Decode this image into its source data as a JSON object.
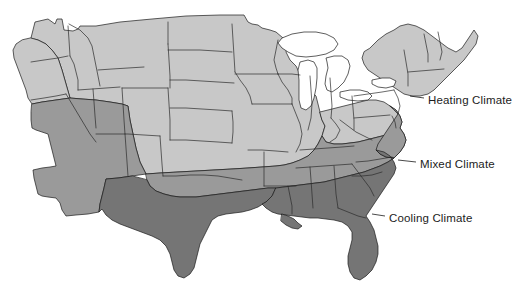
{
  "figure": {
    "width": 515,
    "height": 295,
    "background_color": "#ffffff"
  },
  "legend": {
    "items": [
      {
        "id": "heating",
        "label": "Heating Climate",
        "color": "#c8c8c8",
        "label_position": {
          "x": 428,
          "y": 94
        }
      },
      {
        "id": "mixed",
        "label": "Mixed Climate",
        "color": "#9a9a9a",
        "label_position": {
          "x": 420,
          "y": 158
        }
      },
      {
        "id": "cooling",
        "label": "Cooling Climate",
        "color": "#757575",
        "label_position": {
          "x": 389,
          "y": 212
        }
      }
    ]
  },
  "map": {
    "colors": {
      "heating": "#c8c8c8",
      "mixed": "#9a9a9a",
      "cooling": "#757575",
      "water": "#ffffff",
      "border": "#2b2b2b",
      "outline": "#111111"
    },
    "water_features": [
      {
        "name": "Lake Superior"
      },
      {
        "name": "Lake Michigan"
      },
      {
        "name": "Lake Huron"
      },
      {
        "name": "Lake Erie"
      },
      {
        "name": "Lake Ontario"
      }
    ],
    "zones": [
      {
        "id": "heating",
        "label": "Heating Climate",
        "color": "#c8c8c8",
        "regions": "Pacific Northwest, Northern Rockies, Upper Plains, Midwest, Northeast, New England"
      },
      {
        "id": "mixed",
        "label": "Mixed Climate",
        "color": "#9a9a9a",
        "regions": "Southern California, Southwest, Southern Plains, Mid-South, Mid-Atlantic"
      },
      {
        "id": "cooling",
        "label": "Cooling Climate",
        "color": "#757575",
        "regions": "South Texas, Gulf Coast, Deep South, Florida, Coastal Carolinas"
      }
    ]
  }
}
